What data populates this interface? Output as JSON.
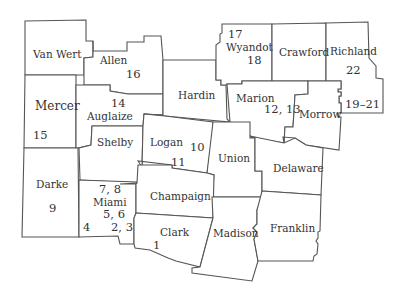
{
  "map": {
    "colors": {
      "stroke": "#555555",
      "fill": "#ffffff",
      "text": "#333333"
    },
    "counties": [
      {
        "name": "Van Wert",
        "numbers": ""
      },
      {
        "name": "Allen",
        "numbers": "16"
      },
      {
        "name": "Mercer",
        "numbers": "15"
      },
      {
        "name": "Auglaize",
        "numbers": "14"
      },
      {
        "name": "Hardin",
        "numbers": ""
      },
      {
        "name": "Wyandot",
        "numbers": "17",
        "numbers2": "18"
      },
      {
        "name": "Crawford",
        "numbers": ""
      },
      {
        "name": "Richland",
        "numbers": "22",
        "numbers2": "19–21"
      },
      {
        "name": "Marion",
        "numbers": "12, 13"
      },
      {
        "name": "Morrow",
        "numbers": ""
      },
      {
        "name": "Shelby",
        "numbers": ""
      },
      {
        "name": "Logan",
        "numbers": "10",
        "numbers2": "11"
      },
      {
        "name": "Union",
        "numbers": ""
      },
      {
        "name": "Delaware",
        "numbers": ""
      },
      {
        "name": "Darke",
        "numbers": "9"
      },
      {
        "name": "Miami",
        "numbers": "7, 8",
        "numbers2": "5, 6",
        "numbers3": "4",
        "numbers4": "2, 3"
      },
      {
        "name": "Champaign",
        "numbers": ""
      },
      {
        "name": "Clark",
        "numbers": "1"
      },
      {
        "name": "Madison",
        "numbers": ""
      },
      {
        "name": "Franklin",
        "numbers": ""
      }
    ]
  }
}
